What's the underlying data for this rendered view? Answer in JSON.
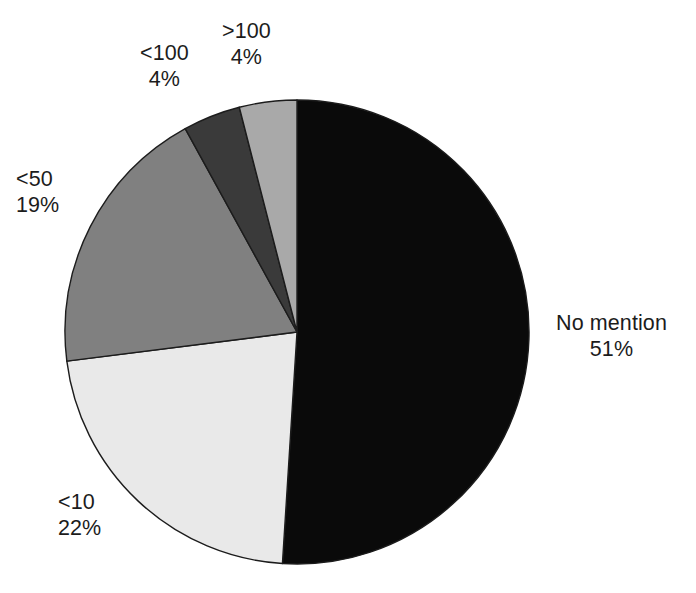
{
  "chart_data": {
    "type": "pie",
    "title": "",
    "subtitle": "",
    "xlabel": "",
    "ylabel": "",
    "legend_position": "none",
    "grid": false,
    "label_format": "name + percent",
    "start_angle_deg": 0,
    "direction": "clockwise",
    "categories": [
      "No mention",
      "<10",
      "<50",
      "<100",
      ">100"
    ],
    "values": [
      51,
      22,
      19,
      4,
      4
    ],
    "value_labels": [
      "51%",
      "22%",
      "19%",
      "4%",
      "4%"
    ],
    "units": "percent",
    "slices": [
      {
        "name": "No mention",
        "value": 51,
        "value_label": "51%",
        "color": "#0a0a0a",
        "start_deg": 0.0,
        "end_deg": 183.6
      },
      {
        "name": "<10",
        "value": 22,
        "value_label": "22%",
        "color": "#e9e9e9",
        "start_deg": 183.6,
        "end_deg": 262.8
      },
      {
        "name": "<50",
        "value": 19,
        "value_label": "19%",
        "color": "#808080",
        "start_deg": 262.8,
        "end_deg": 331.2
      },
      {
        "name": "<100",
        "value": 4,
        "value_label": "4%",
        "color": "#3a3a3a",
        "start_deg": 331.2,
        "end_deg": 345.6
      },
      {
        "name": ">100",
        "value": 4,
        "value_label": "4%",
        "color": "#a9a9a9",
        "start_deg": 345.6,
        "end_deg": 360.0
      }
    ]
  },
  "colors": {
    "background": "#ffffff",
    "text": "#1c1c1c",
    "slice_outline": "#1c1c1c",
    "no_mention": "#0a0a0a",
    "lt10": "#e9e9e9",
    "lt50": "#808080",
    "lt100": "#3a3a3a",
    "gt100": "#a9a9a9"
  }
}
